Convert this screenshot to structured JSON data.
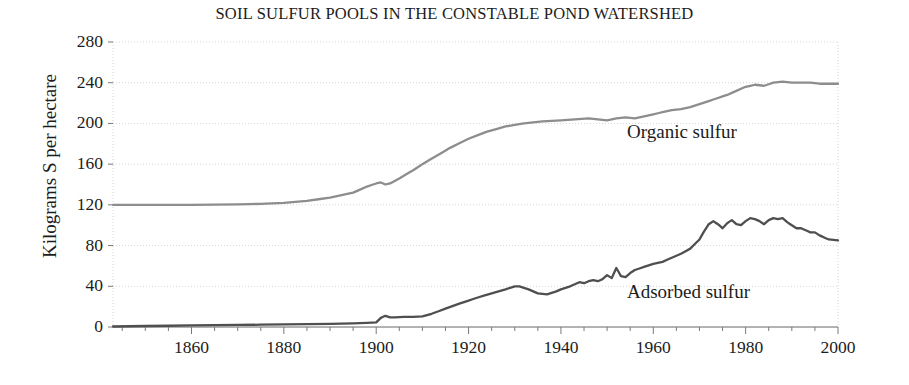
{
  "chart_data": {
    "type": "line",
    "title": "SOIL SULFUR POOLS IN THE CONSTABLE POND WATERSHED",
    "xlabel": "",
    "ylabel": "Kilograms S per hectare",
    "xlim": [
      1843,
      2000
    ],
    "ylim": [
      0,
      280
    ],
    "yticks": [
      0,
      40,
      80,
      120,
      160,
      200,
      240,
      280
    ],
    "ytick_labels": [
      "0",
      "40",
      "80",
      "120",
      "160",
      "200",
      "240",
      "280"
    ],
    "xticks": [
      1860,
      1880,
      1900,
      1920,
      1940,
      1960,
      1980,
      2000
    ],
    "xtick_labels": [
      "1860",
      "1880",
      "1900",
      "1920",
      "1940",
      "1960",
      "1980",
      "2000"
    ],
    "grid": true,
    "legend_position": "inline-annotations",
    "series": [
      {
        "name": "Organic sulfur",
        "color": "#8d8d8d",
        "label_x": 1962,
        "label_y": 185,
        "x": [
          1843,
          1850,
          1860,
          1870,
          1875,
          1880,
          1885,
          1890,
          1895,
          1898,
          1900,
          1901,
          1902,
          1903,
          1905,
          1908,
          1910,
          1913,
          1916,
          1920,
          1924,
          1928,
          1932,
          1936,
          1940,
          1943,
          1946,
          1948,
          1950,
          1952,
          1954,
          1956,
          1958,
          1960,
          1962,
          1964,
          1966,
          1968,
          1970,
          1972,
          1974,
          1976,
          1978,
          1980,
          1982,
          1984,
          1986,
          1988,
          1990,
          1992,
          1994,
          1996,
          1998,
          2000
        ],
        "y": [
          120,
          120,
          120,
          120.5,
          121,
          122,
          124,
          127,
          132,
          138,
          141,
          142,
          140,
          141,
          146,
          154,
          160,
          168,
          176,
          185,
          192,
          197,
          200,
          202,
          203,
          204,
          205,
          204,
          203,
          205,
          206,
          205,
          207,
          209,
          211,
          213,
          214,
          216,
          219,
          222,
          225,
          228,
          232,
          236,
          238,
          237,
          240,
          241,
          240,
          240,
          240,
          239,
          239,
          239
        ]
      },
      {
        "name": "Adsorbed sulfur",
        "color": "#4f4f4f",
        "label_x": 1962,
        "label_y": 30,
        "x": [
          1843,
          1850,
          1860,
          1870,
          1880,
          1890,
          1895,
          1898,
          1900,
          1901,
          1902,
          1903,
          1904,
          1906,
          1908,
          1910,
          1912,
          1915,
          1918,
          1920,
          1922,
          1925,
          1928,
          1930,
          1931,
          1933,
          1935,
          1937,
          1939,
          1940,
          1942,
          1944,
          1945,
          1946,
          1947,
          1948,
          1949,
          1950,
          1951,
          1952,
          1953,
          1954,
          1955,
          1956,
          1958,
          1960,
          1962,
          1964,
          1966,
          1968,
          1970,
          1971,
          1972,
          1973,
          1974,
          1975,
          1976,
          1977,
          1978,
          1979,
          1980,
          1981,
          1982,
          1983,
          1984,
          1985,
          1986,
          1987,
          1988,
          1989,
          1990,
          1991,
          1992,
          1993,
          1994,
          1995,
          1996,
          1997,
          1998,
          2000
        ],
        "y": [
          0.5,
          1,
          1.5,
          2,
          2.5,
          3,
          3.5,
          4,
          4.5,
          9,
          11,
          9.5,
          9.5,
          10,
          10,
          10.5,
          13,
          18,
          23,
          26,
          29,
          33,
          37,
          40,
          40,
          37,
          33,
          32,
          35,
          37,
          40,
          44,
          43,
          45,
          46,
          45,
          47,
          51,
          48,
          58,
          50,
          49,
          53,
          56,
          59,
          62,
          64,
          68,
          72,
          77,
          86,
          94,
          101,
          104,
          101,
          97,
          102,
          105,
          101,
          100,
          104,
          107,
          106,
          104,
          101,
          105,
          107,
          106,
          107,
          103,
          100,
          97,
          97,
          95,
          93,
          93,
          90,
          88,
          86,
          85
        ]
      }
    ]
  },
  "axis": {
    "axis_color": "#7a7a7a",
    "grid_color": "#d6d6d6"
  }
}
